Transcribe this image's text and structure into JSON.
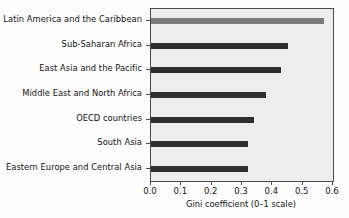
{
  "chart_data": {
    "type": "bar",
    "orientation": "horizontal",
    "title": "",
    "xlabel": "Gini coefficient (0–1 scale)",
    "ylabel": "",
    "xlim": [
      0.0,
      0.6
    ],
    "xticks": [
      "0.0",
      "0.1",
      "0.2",
      "0.3",
      "0.4",
      "0.5",
      "0.6"
    ],
    "xtick_values": [
      0.0,
      0.1,
      0.2,
      0.3,
      0.4,
      0.5,
      0.6
    ],
    "grid": false,
    "legend": false,
    "categories": [
      "Latin America and the Caribbean",
      "Sub-Saharan Africa",
      "East Asia and the Pacific",
      "Middle East and North Africa",
      "OECD countries",
      "South Asia",
      "Eastern Europe and Central Asia"
    ],
    "values": [
      0.57,
      0.45,
      0.43,
      0.38,
      0.34,
      0.32,
      0.32
    ],
    "bar_colors": [
      "#7b7b7b",
      "#2f2f2f",
      "#2f2f2f",
      "#2f2f2f",
      "#2f2f2f",
      "#2f2f2f",
      "#2f2f2f"
    ],
    "colors": {
      "plot_background": "#ededed",
      "page_background": "#fdfdfd",
      "axis": "#4a4a4a",
      "text": "#141414",
      "bar_default": "#2f2f2f",
      "bar_highlight": "#7b7b7b"
    }
  }
}
